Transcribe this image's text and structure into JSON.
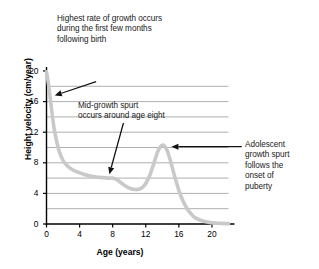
{
  "chart_data": {
    "type": "line",
    "title": "",
    "xlabel": "Age (years)",
    "ylabel": "Height velocity (cm/year)",
    "xlim": [
      0,
      22
    ],
    "ylim": [
      0,
      20
    ],
    "xticks": [
      0,
      4,
      8,
      12,
      16,
      20
    ],
    "yticks": [
      0,
      4,
      8,
      12,
      16,
      20
    ],
    "gridlines_y": [
      2,
      4,
      6,
      8,
      10,
      12,
      14,
      16,
      18
    ],
    "grid": true,
    "legend": "none",
    "series": [
      {
        "name": "Height velocity",
        "color": "#c9c9c9",
        "x": [
          0,
          0.25,
          0.5,
          0.75,
          1,
          1.5,
          2,
          2.5,
          3,
          3.5,
          4,
          4.5,
          5,
          5.5,
          6,
          6.5,
          7,
          7.5,
          8,
          8.5,
          9,
          9.5,
          10,
          10.5,
          11,
          11.5,
          12,
          12.5,
          13,
          13.5,
          14,
          14.5,
          15,
          15.5,
          16,
          16.5,
          17,
          17.5,
          18,
          19,
          20,
          21,
          22
        ],
        "y": [
          19.9,
          18.2,
          16.0,
          13.8,
          12.0,
          9.6,
          8.3,
          7.6,
          7.2,
          6.9,
          6.7,
          6.5,
          6.35,
          6.25,
          6.15,
          6.1,
          6.05,
          6.0,
          6.0,
          5.8,
          5.4,
          5.0,
          4.7,
          4.55,
          4.5,
          4.7,
          5.3,
          6.4,
          8.0,
          9.6,
          10.3,
          9.8,
          8.2,
          6.2,
          4.4,
          3.0,
          2.0,
          1.3,
          0.8,
          0.35,
          0.15,
          0.08,
          0.05
        ]
      }
    ],
    "annotations": [
      {
        "name": "infancy-annotation",
        "text": "Highest rate of growth occurs\nduring the first few months\nfollowing birth",
        "arrow_from": [
          6.0,
          18.6
        ],
        "arrow_to": [
          1.0,
          16.8
        ]
      },
      {
        "name": "mid-growth-annotation",
        "text": "Mid-growth spurt\noccurs around age eight",
        "arrow_from": [
          9.3,
          13.2
        ],
        "arrow_to": [
          7.6,
          6.5
        ]
      },
      {
        "name": "adolescent-annotation",
        "text": "Adolescent\ngrowth spurt\nfollows the\nonset of\npuberty",
        "arrow_from": [
          23.6,
          10.1
        ],
        "arrow_to": [
          15.1,
          10.1
        ]
      }
    ]
  },
  "axes": {
    "xlabel": "Age (years)",
    "ylabel": "Height velocity (cm/year)",
    "xticklabels": [
      "0",
      "4",
      "8",
      "12",
      "16",
      "20"
    ],
    "yticklabels": [
      "0",
      "4",
      "8",
      "12",
      "16",
      "20"
    ]
  },
  "annotations": {
    "infancy": "Highest rate of growth occurs\nduring the first few months\nfollowing birth",
    "midgrowth": "Mid-growth spurt\noccurs around age eight",
    "adolescent": "Adolescent\ngrowth spurt\nfollows the\nonset of\npuberty"
  },
  "colors": {
    "curve": "#c9c9c9",
    "grid": "#9a9a9a",
    "axis": "#000000",
    "text": "#1a1a1a"
  }
}
